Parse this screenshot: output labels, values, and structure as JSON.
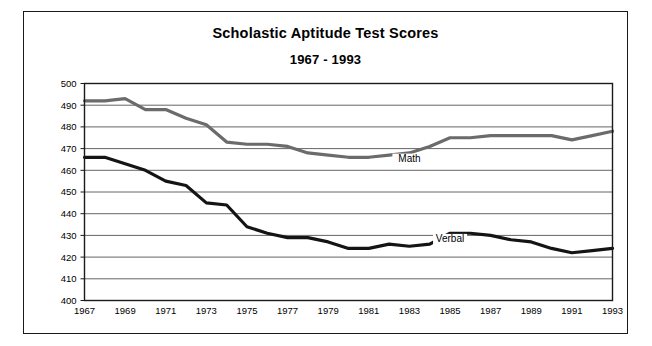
{
  "chart_data": {
    "type": "line",
    "title": "Scholastic Aptitude Test Scores",
    "subtitle": "1967 - 1993",
    "xlabel": "",
    "ylabel": "",
    "ylim": [
      400,
      500
    ],
    "ytick_step": 10,
    "yticks": [
      400,
      410,
      420,
      430,
      440,
      450,
      460,
      470,
      480,
      490,
      500
    ],
    "xlim": [
      1967,
      1993
    ],
    "xticks": [
      1967,
      1969,
      1971,
      1973,
      1975,
      1977,
      1979,
      1981,
      1983,
      1985,
      1987,
      1989,
      1991,
      1993
    ],
    "x": [
      1967,
      1968,
      1969,
      1970,
      1971,
      1972,
      1973,
      1974,
      1975,
      1976,
      1977,
      1978,
      1979,
      1980,
      1981,
      1982,
      1983,
      1984,
      1985,
      1986,
      1987,
      1988,
      1989,
      1990,
      1991,
      1992,
      1993
    ],
    "grid": true,
    "grid_axis": "y",
    "legend_position": "inline-annotation",
    "series": [
      {
        "name": "Math",
        "color": "#6b6b6b",
        "values": [
          492,
          492,
          493,
          488,
          488,
          484,
          481,
          473,
          472,
          472,
          471,
          468,
          467,
          466,
          466,
          467,
          468,
          471,
          475,
          475,
          476,
          476,
          476,
          476,
          474,
          476,
          478
        ]
      },
      {
        "name": "Verbal",
        "color": "#141414",
        "values": [
          466,
          466,
          463,
          460,
          455,
          453,
          445,
          444,
          434,
          431,
          429,
          429,
          427,
          424,
          424,
          426,
          425,
          426,
          431,
          431,
          430,
          428,
          427,
          424,
          422,
          423,
          424
        ]
      }
    ],
    "annotations": [
      {
        "text": "Math",
        "x": 1983,
        "y": 464
      },
      {
        "text": "Verbal",
        "x": 1985,
        "y": 427
      }
    ]
  },
  "axis": {
    "y_labels": [
      "500",
      "490",
      "480",
      "470",
      "460",
      "450",
      "440",
      "430",
      "420",
      "410",
      "400"
    ],
    "x_labels": [
      "1967",
      "1969",
      "1971",
      "1973",
      "1975",
      "1977",
      "1979",
      "1981",
      "1983",
      "1985",
      "1987",
      "1989",
      "1991",
      "1993"
    ]
  },
  "colors": {
    "math_line": "#6b6b6b",
    "verbal_line": "#141414",
    "grid": "#555555",
    "frame": "#1a1a1a",
    "background": "#ffffff"
  }
}
